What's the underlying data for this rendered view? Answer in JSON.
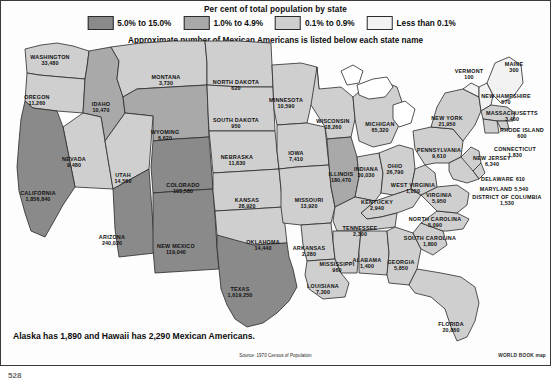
{
  "legend": {
    "title": "Per cent of total population by state",
    "subtitle": "Approximate number of Mexican Americans is listed below each state name",
    "items": [
      {
        "label": "5.0% to 15.0%",
        "color": "#8a8a8a"
      },
      {
        "label": "1.0% to 4.9%",
        "color": "#a9a9a9"
      },
      {
        "label": "0.1% to 0.9%",
        "color": "#cfcfcf"
      },
      {
        "label": "Less than 0.1%",
        "color": "#f2f2f2"
      }
    ]
  },
  "footnote": "Alaska has 1,890 and Hawaii has 2,290 Mexican Americans.",
  "source": "Source: 1970 Census of Population",
  "credit": "WORLD BOOK map",
  "page_number": "528",
  "map_data": {
    "type": "choropleth",
    "title": "Per cent of total population by state",
    "unit": "Mexican Americans (1970 Census)",
    "bins": [
      {
        "label": "5.0% to 15.0%",
        "color": "#8a8a8a"
      },
      {
        "label": "1.0% to 4.9%",
        "color": "#a9a9a9"
      },
      {
        "label": "0.1% to 0.9%",
        "color": "#cfcfcf"
      },
      {
        "label": "Less than 0.1%",
        "color": "#f2f2f2"
      }
    ],
    "non_contiguous": [
      {
        "name": "ALASKA",
        "value": "1,890"
      },
      {
        "name": "HAWAII",
        "value": "2,290"
      }
    ]
  },
  "states": [
    {
      "id": "wa",
      "name": "WASHINGTON",
      "value": "33,480",
      "bin": 2,
      "x": 49,
      "y": 60
    },
    {
      "id": "or",
      "name": "OREGON",
      "value": "11,260",
      "bin": 2,
      "x": 36,
      "y": 100
    },
    {
      "id": "id",
      "name": "IDAHO",
      "value": "10,470",
      "bin": 1,
      "x": 100,
      "y": 107
    },
    {
      "id": "mt",
      "name": "MONTANA",
      "value": "3,730",
      "bin": 2,
      "x": 165,
      "y": 80
    },
    {
      "id": "wy",
      "name": "WYOMING",
      "value": "6,620",
      "bin": 1,
      "x": 164,
      "y": 135
    },
    {
      "id": "nd",
      "name": "NORTH DAKOTA",
      "value": "620",
      "bin": 2,
      "x": 235,
      "y": 85
    },
    {
      "id": "sd",
      "name": "SOUTH DAKOTA",
      "value": "950",
      "bin": 2,
      "x": 235,
      "y": 123
    },
    {
      "id": "ne",
      "name": "NEBRASKA",
      "value": "11,830",
      "bin": 2,
      "x": 236,
      "y": 160
    },
    {
      "id": "nv",
      "name": "NEVADA",
      "value": "9,480",
      "bin": 2,
      "x": 73,
      "y": 162
    },
    {
      "id": "ut",
      "name": "UTAH",
      "value": "14,560",
      "bin": 2,
      "x": 122,
      "y": 178
    },
    {
      "id": "ca",
      "name": "CALIFORNIA",
      "value": "1,856,840",
      "bin": 0,
      "x": 37,
      "y": 196
    },
    {
      "id": "az",
      "name": "ARIZONA",
      "value": "240,020",
      "bin": 0,
      "x": 111,
      "y": 240
    },
    {
      "id": "co",
      "name": "COLORADO",
      "value": "103,580",
      "bin": 0,
      "x": 182,
      "y": 188
    },
    {
      "id": "nm",
      "name": "NEW MEXICO",
      "value": "119,040",
      "bin": 0,
      "x": 175,
      "y": 249
    },
    {
      "id": "ks",
      "name": "KANSAS",
      "value": "28,920",
      "bin": 2,
      "x": 246,
      "y": 203
    },
    {
      "id": "ok",
      "name": "OKLAHOMA",
      "value": "14,440",
      "bin": 2,
      "x": 262,
      "y": 245
    },
    {
      "id": "tx",
      "name": "TEXAS",
      "value": "1,619,250",
      "bin": 0,
      "x": 239,
      "y": 292
    },
    {
      "id": "mn",
      "name": "MINNESOTA",
      "value": "10,590",
      "bin": 2,
      "x": 285,
      "y": 103
    },
    {
      "id": "ia",
      "name": "IOWA",
      "value": "7,410",
      "bin": 2,
      "x": 295,
      "y": 156
    },
    {
      "id": "mo",
      "name": "MISSOURI",
      "value": "13,920",
      "bin": 2,
      "x": 308,
      "y": 203
    },
    {
      "id": "ar",
      "name": "ARKANSAS",
      "value": "2,280",
      "bin": 2,
      "x": 308,
      "y": 251
    },
    {
      "id": "la",
      "name": "LOUISIANA",
      "value": "7,300",
      "bin": 2,
      "x": 322,
      "y": 289
    },
    {
      "id": "wi",
      "name": "WISCONSIN",
      "value": "18,260",
      "bin": 2,
      "x": 332,
      "y": 124
    },
    {
      "id": "il",
      "name": "ILLINOIS",
      "value": "180,470",
      "bin": 1,
      "x": 340,
      "y": 177
    },
    {
      "id": "mi",
      "name": "MICHIGAN",
      "value": "65,320",
      "bin": 2,
      "x": 379,
      "y": 127
    },
    {
      "id": "in",
      "name": "INDIANA",
      "value": "30,030",
      "bin": 2,
      "x": 365,
      "y": 172
    },
    {
      "id": "oh",
      "name": "OHIO",
      "value": "26,790",
      "bin": 2,
      "x": 394,
      "y": 169
    },
    {
      "id": "ky",
      "name": "KENTUCKY",
      "value": "2,940",
      "bin": 2,
      "x": 376,
      "y": 205
    },
    {
      "id": "tn",
      "name": "TENNESSEE",
      "value": "2,300",
      "bin": 2,
      "x": 359,
      "y": 231
    },
    {
      "id": "ms",
      "name": "MISSISSIPPI",
      "value": "960",
      "bin": 2,
      "x": 336,
      "y": 267
    },
    {
      "id": "al",
      "name": "ALABAMA",
      "value": "1,400",
      "bin": 2,
      "x": 366,
      "y": 263
    },
    {
      "id": "ga",
      "name": "GEORGIA",
      "value": "5,850",
      "bin": 2,
      "x": 400,
      "y": 265
    },
    {
      "id": "fl",
      "name": "FLORIDA",
      "value": "20,860",
      "bin": 2,
      "x": 450,
      "y": 327
    },
    {
      "id": "sc",
      "name": "SOUTH CAROLINA",
      "value": "1,800",
      "bin": 2,
      "x": 429,
      "y": 241
    },
    {
      "id": "nc",
      "name": "NORTH CAROLINA",
      "value": "5,090",
      "bin": 2,
      "x": 434,
      "y": 222
    },
    {
      "id": "va",
      "name": "VIRGINIA",
      "value": "5,950",
      "bin": 2,
      "x": 438,
      "y": 198
    },
    {
      "id": "wv",
      "name": "WEST VIRGINIA",
      "value": "1,050",
      "bin": 2,
      "x": 412,
      "y": 188
    },
    {
      "id": "pa",
      "name": "PENNSYLVANIA",
      "value": "9,610",
      "bin": 2,
      "x": 438,
      "y": 153
    },
    {
      "id": "ny",
      "name": "NEW YORK",
      "value": "21,950",
      "bin": 2,
      "x": 446,
      "y": 121
    },
    {
      "id": "vt",
      "name": "VERMONT",
      "value": "100",
      "bin": 3,
      "x": 468,
      "y": 74
    },
    {
      "id": "nh",
      "name": "NEW HAMPSHIRE",
      "value": "570",
      "bin": 3,
      "x": 505,
      "y": 99
    },
    {
      "id": "me",
      "name": "MAINE",
      "value": "300",
      "bin": 3,
      "x": 513,
      "y": 67
    },
    {
      "id": "ma",
      "name": "MASSACHUSETTS",
      "value": "3,460",
      "bin": 2,
      "x": 511,
      "y": 116
    },
    {
      "id": "ri",
      "name": "RHODE ISLAND",
      "value": "600",
      "bin": 2,
      "x": 521,
      "y": 133
    },
    {
      "id": "ct",
      "name": "CONNECTICUT",
      "value": "1,830",
      "bin": 2,
      "x": 514,
      "y": 152
    },
    {
      "id": "nj",
      "name": "NEW JERSEY",
      "value": "6,340",
      "bin": 2,
      "x": 491,
      "y": 161
    },
    {
      "id": "de",
      "name": "DELAWARE",
      "value": "610",
      "bin": 2,
      "x": 502,
      "y": 175
    },
    {
      "id": "md",
      "name": "MARYLAND",
      "value": "5,540",
      "bin": 2,
      "x": 503,
      "y": 185
    },
    {
      "id": "dc",
      "name": "DISTRICT OF COLUMBIA",
      "value": "1,530",
      "bin": 2,
      "x": 506,
      "y": 200
    }
  ]
}
